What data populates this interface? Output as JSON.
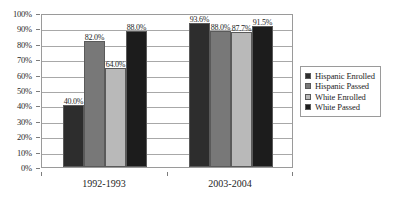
{
  "chart_data": {
    "type": "bar",
    "title": "",
    "subtitle": "",
    "xlabel": "",
    "ylabel": "",
    "categories": [
      "1992-1993",
      "2003-2004"
    ],
    "series": [
      {
        "name": "Hispanic Enrolled",
        "color": "#2d2d2d",
        "values": [
          40.0,
          93.6
        ],
        "labels": [
          "40.0%",
          "93.6%"
        ]
      },
      {
        "name": "Hispanic Passed",
        "color": "#787878",
        "values": [
          82.0,
          88.0
        ],
        "labels": [
          "82.0%",
          "88.0%"
        ]
      },
      {
        "name": "White Enrolled",
        "color": "#b9b9b9",
        "values": [
          64.0,
          87.7
        ],
        "labels": [
          "64.0%",
          "87.7%"
        ]
      },
      {
        "name": "White Passed",
        "color": "#1c1c1c",
        "values": [
          88.0,
          91.5
        ],
        "labels": [
          "88.0%",
          "91.5%"
        ]
      }
    ],
    "ylim": [
      0,
      100
    ],
    "y_ticks": [
      "0%",
      "10%",
      "20%",
      "30%",
      "40%",
      "50%",
      "60%",
      "70%",
      "80%",
      "90%",
      "100%"
    ],
    "y_tick_values": [
      0,
      10,
      20,
      30,
      40,
      50,
      60,
      70,
      80,
      90,
      100
    ],
    "grid": true,
    "legend_position": "right"
  },
  "legend": {
    "items": [
      {
        "label": "Hispanic Enrolled",
        "color": "#2d2d2d"
      },
      {
        "label": "Hispanic Passed",
        "color": "#787878"
      },
      {
        "label": "White Enrolled",
        "color": "#b9b9b9"
      },
      {
        "label": "White Passed",
        "color": "#1c1c1c"
      }
    ]
  }
}
